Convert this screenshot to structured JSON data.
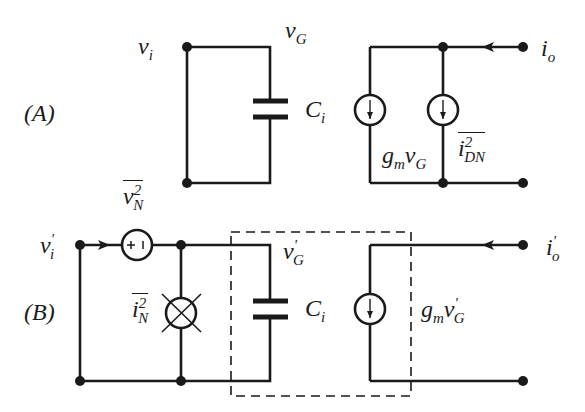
{
  "diagram": {
    "type": "small-signal noise equivalent circuit",
    "panels": [
      {
        "id": "A",
        "label": "(A)",
        "nodes": {
          "input": "v",
          "input_sub": "i",
          "gate": "v",
          "gate_sub": "G",
          "output": "i",
          "output_sub": "o"
        },
        "capacitor": {
          "name": "C",
          "sub": "i"
        },
        "sources": [
          {
            "kind": "current",
            "expr_main": "g",
            "expr_sub": "m",
            "expr_v": "v",
            "expr_vsub": "G"
          },
          {
            "kind": "noise-current",
            "name": "i",
            "sup": "2",
            "sub": "DN"
          }
        ]
      },
      {
        "id": "B",
        "label": "(B)",
        "nodes": {
          "input": "v",
          "input_prime": "'",
          "input_sub": "i",
          "gate": "v",
          "gate_prime": "'",
          "gate_sub": "G",
          "output": "i",
          "output_prime": "'",
          "output_sub": "o"
        },
        "capacitor": {
          "name": "C",
          "sub": "i"
        },
        "sources": [
          {
            "kind": "noise-voltage",
            "name": "v",
            "sup": "2",
            "sub": "N",
            "polarity": "+ -"
          },
          {
            "kind": "noise-current",
            "name": "i",
            "sup": "2",
            "sub": "N"
          },
          {
            "kind": "current",
            "expr_main": "g",
            "expr_sub": "m",
            "expr_v": "v",
            "expr_vprime": "'",
            "expr_vsub": "G"
          }
        ],
        "dashed_box": "noiseless device"
      }
    ]
  }
}
